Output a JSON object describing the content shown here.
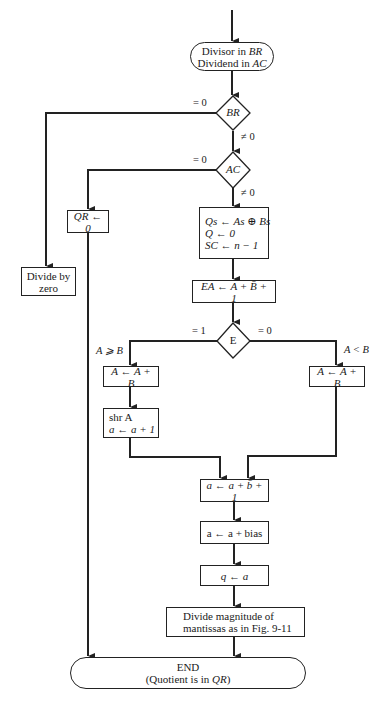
{
  "diagram": {
    "type": "flowchart",
    "start": {
      "line1_text": "Divisor in ",
      "line1_var": "BR",
      "line2_text": "Dividend in ",
      "line2_var": "AC"
    },
    "decisions": {
      "br": {
        "label": "BR",
        "yes_label": "= 0",
        "no_label": "≠ 0"
      },
      "ac": {
        "label": "AC",
        "yes_label": "= 0",
        "no_label": "≠ 0"
      },
      "e": {
        "label": "E",
        "left_label": "= 1",
        "right_label": "= 0",
        "left_cond": "A ⩾ B",
        "right_cond": "A < B"
      }
    },
    "boxes": {
      "divide_by_zero": {
        "line1": "Divide by",
        "line2": "zero"
      },
      "qr_zero": {
        "text": "QR ← 0"
      },
      "init": {
        "line1": "Qs ← As ⊕ Bs",
        "line2": "Q ← 0",
        "line3": "SC ← n − 1"
      },
      "ea": {
        "text": "EA ← A + B̄ + 1"
      },
      "left_add": {
        "text": "A ← A + B"
      },
      "shr": {
        "line1": "shr A",
        "line2": "a ← a + 1"
      },
      "right_add": {
        "text": "A ← A + B"
      },
      "exp_sub": {
        "text": "a ← a + b̄ + 1"
      },
      "bias": {
        "text": "a ← a + bias"
      },
      "q_assign": {
        "text": "q ← a"
      },
      "divide_mag": {
        "line1": "Divide magnitude of",
        "line2": "mantissas as in Fig. 9-11"
      }
    },
    "end": {
      "line1": "END",
      "line2_text": "(Quotient is in ",
      "line2_var": "QR",
      "line2_close": ")"
    },
    "colors": {
      "stroke": "#222222",
      "background": "#ffffff"
    }
  }
}
